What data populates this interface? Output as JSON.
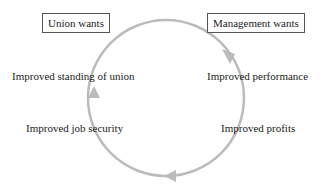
{
  "diagram": {
    "type": "cycle",
    "colors": {
      "arrow": "#bbbbbb",
      "text": "#222222",
      "box_border": "#555555",
      "background": "#ffffff"
    },
    "headers": {
      "union": "Union wants",
      "management": "Management wants"
    },
    "union_items": [
      "Improved standing of union",
      "Improved job security"
    ],
    "management_items": [
      "Improved performance",
      "Improved profits"
    ],
    "arrows": {
      "direction": "clockwise",
      "count": 3
    }
  }
}
